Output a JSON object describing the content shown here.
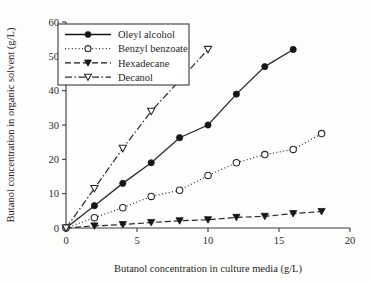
{
  "chart_data": {
    "type": "line",
    "title": "",
    "xlabel": "Butanol concentration in culture media (g/L)",
    "ylabel": "Butanol concentration in organic solvent (g/L)",
    "xlim": [
      0,
      20
    ],
    "ylim": [
      0,
      60
    ],
    "xticks": [
      0,
      5,
      10,
      15,
      20
    ],
    "yticks": [
      0,
      10,
      20,
      30,
      40,
      50,
      60
    ],
    "xtick_labels": [
      "0",
      "5",
      "10",
      "15",
      "20"
    ],
    "ytick_labels": [
      "0",
      "10",
      "20",
      "30",
      "40",
      "50",
      "60"
    ],
    "grid": false,
    "legend_position": "upper-left",
    "series": [
      {
        "name": "Oleyl alcohol",
        "marker": "filled-circle",
        "line_style": "solid",
        "color": "#161616",
        "x": [
          0,
          2,
          4,
          6,
          8,
          10,
          12,
          14,
          16
        ],
        "values": [
          0,
          6.5,
          13,
          19,
          26.3,
          30,
          39,
          47,
          52
        ]
      },
      {
        "name": "Benzyl benzoate",
        "marker": "open-circle",
        "line_style": "dotted",
        "color": "#2a2a2a",
        "x": [
          0,
          2,
          4,
          6,
          8,
          10,
          12,
          14,
          16,
          18
        ],
        "values": [
          0,
          3,
          5.9,
          9.2,
          11,
          15.3,
          19,
          21.4,
          22.9,
          27.5
        ]
      },
      {
        "name": "Hexadecane",
        "marker": "filled-triangle-down",
        "line_style": "dashed",
        "color": "#161616",
        "x": [
          0,
          2,
          4,
          6,
          8,
          10,
          12,
          14,
          16,
          18
        ],
        "values": [
          0,
          0.6,
          1.0,
          1.6,
          2.1,
          2.4,
          3.1,
          3.4,
          4.2,
          4.8
        ]
      },
      {
        "name": "Decanol",
        "marker": "open-triangle-down",
        "line_style": "dashdot",
        "color": "#2a2a2a",
        "x": [
          0,
          2,
          4,
          6,
          10
        ],
        "values": [
          0,
          11.5,
          23.2,
          34,
          52
        ]
      }
    ]
  }
}
